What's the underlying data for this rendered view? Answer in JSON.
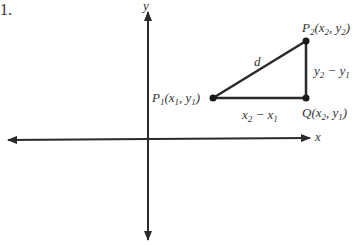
{
  "figure": {
    "number_label": "1.",
    "axes": {
      "x_label": "x",
      "y_label": "y"
    },
    "points": {
      "p1": {
        "name": "P",
        "sub": "1",
        "coords_open": "(x",
        "c1_sub": "1",
        "sep": ", y",
        "c2_sub": "1",
        "close": ")"
      },
      "p2": {
        "name": "P",
        "sub": "2",
        "coords_open": "(x",
        "c1_sub": "2",
        "sep": ", y",
        "c2_sub": "2",
        "close": ")"
      },
      "q": {
        "name": "Q",
        "coords_open": "(x",
        "c1_sub": "2",
        "sep": ", y",
        "c2_sub": "1",
        "close": ")"
      }
    },
    "segments": {
      "hyp": "d",
      "horiz": {
        "a": "x",
        "a_sub": "2",
        "op": " − x",
        "b_sub": "1"
      },
      "vert": {
        "a": "y",
        "a_sub": "2",
        "op": " − y",
        "b_sub": "1"
      }
    },
    "colors": {
      "line": "#2a2a2a",
      "background": "#ffffff"
    }
  }
}
